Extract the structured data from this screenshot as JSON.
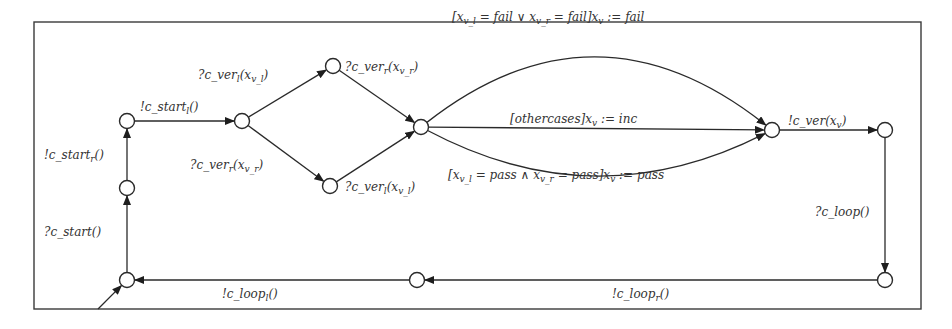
{
  "diagram": {
    "type": "timed-automaton-state-machine",
    "colors": {
      "stroke": "#2a2a2a",
      "text": "#333333",
      "background": "#ffffff"
    },
    "nodes": [
      {
        "id": "n1",
        "name": "start-left-location"
      },
      {
        "id": "n2",
        "name": "fork-location"
      },
      {
        "id": "n3",
        "name": "left-verified-location"
      },
      {
        "id": "n4",
        "name": "right-verified-location"
      },
      {
        "id": "n5",
        "name": "join-location"
      },
      {
        "id": "n6",
        "name": "verdict-location"
      },
      {
        "id": "n7",
        "name": "ver-sent-location"
      },
      {
        "id": "n8",
        "name": "loop-received-location"
      },
      {
        "id": "n9",
        "name": "loop-right-location"
      },
      {
        "id": "n10",
        "name": "initial-location"
      },
      {
        "id": "n11",
        "name": "start-received-location"
      }
    ],
    "edges": [
      {
        "from": "n10",
        "to": "n11",
        "label": {
          "text": "?c_start()",
          "parts": [
            [
              "?c_start()",
              ""
            ]
          ]
        }
      },
      {
        "from": "n11",
        "to": "n1",
        "label": {
          "text": "!c_start_r()",
          "parts": [
            [
              "!c_start",
              ""
            ],
            [
              "r",
              "sub"
            ],
            [
              "()",
              ""
            ]
          ]
        }
      },
      {
        "from": "n1",
        "to": "n2",
        "label": {
          "text": "!c_start_l()",
          "parts": [
            [
              "!c_start",
              ""
            ],
            [
              "l",
              "sub"
            ],
            [
              "()",
              ""
            ]
          ]
        }
      },
      {
        "from": "n2",
        "to": "n3",
        "label": {
          "text": "?c_ver_l(x_v_l)",
          "parts": [
            [
              "?c_ver",
              ""
            ],
            [
              "l",
              "sub"
            ],
            [
              "(x",
              ""
            ],
            [
              "v_l",
              "sub"
            ],
            [
              ")",
              ""
            ]
          ]
        }
      },
      {
        "from": "n2",
        "to": "n4",
        "label": {
          "text": "?c_ver_r(x_v_r)",
          "parts": [
            [
              "?c_ver",
              ""
            ],
            [
              "r",
              "sub"
            ],
            [
              "(x",
              ""
            ],
            [
              "v_r",
              "sub"
            ],
            [
              ")",
              ""
            ]
          ]
        }
      },
      {
        "from": "n3",
        "to": "n5",
        "label": {
          "text": "?c_ver_r(x_v_r)",
          "parts": [
            [
              "?c_ver",
              ""
            ],
            [
              "r",
              "sub"
            ],
            [
              "(x",
              ""
            ],
            [
              "v_r",
              "sub"
            ],
            [
              ")",
              ""
            ]
          ]
        }
      },
      {
        "from": "n4",
        "to": "n5",
        "label": {
          "text": "?c_ver_l(x_v_l)",
          "parts": [
            [
              "?c_ver",
              ""
            ],
            [
              "l",
              "sub"
            ],
            [
              "(x",
              ""
            ],
            [
              "v_l",
              "sub"
            ],
            [
              ")",
              ""
            ]
          ]
        }
      },
      {
        "from": "n5",
        "to": "n6",
        "label": {
          "text": "[x_v_l = fail ∨ x_v_r = fail]x_v := fail",
          "parts": [
            [
              "[x",
              ""
            ],
            [
              "v_l",
              "sub"
            ],
            [
              " = fail ∨ x",
              ""
            ],
            [
              "v_r",
              "sub"
            ],
            [
              " = fail]x",
              ""
            ],
            [
              "v",
              "sub"
            ],
            [
              " := fail",
              ""
            ]
          ]
        }
      },
      {
        "from": "n5",
        "to": "n6",
        "label": {
          "text": "[othercases]x_v := inc",
          "parts": [
            [
              "[othercases]x",
              ""
            ],
            [
              "v",
              "sub"
            ],
            [
              " := inc",
              ""
            ]
          ]
        }
      },
      {
        "from": "n5",
        "to": "n6",
        "label": {
          "text": "[x_v_l = pass ∧ x_v_r = pass]x_v := pass",
          "parts": [
            [
              "[x",
              ""
            ],
            [
              "v_l",
              "sub"
            ],
            [
              " = pass ∧ x",
              ""
            ],
            [
              "v_r",
              "sub"
            ],
            [
              " = pass]x",
              ""
            ],
            [
              "v",
              "sub"
            ],
            [
              " := pass",
              ""
            ]
          ]
        }
      },
      {
        "from": "n6",
        "to": "n7",
        "label": {
          "text": "!c_ver(x_v)",
          "parts": [
            [
              "!c_ver(x",
              ""
            ],
            [
              "v",
              "sub"
            ],
            [
              ")",
              ""
            ]
          ]
        }
      },
      {
        "from": "n7",
        "to": "n8",
        "label": {
          "text": "?c_loop()",
          "parts": [
            [
              "?c_loop()",
              ""
            ]
          ]
        }
      },
      {
        "from": "n8",
        "to": "n9",
        "label": {
          "text": "!c_loop_r()",
          "parts": [
            [
              "!c_loop",
              ""
            ],
            [
              "r",
              "sub"
            ],
            [
              "()",
              ""
            ]
          ]
        }
      },
      {
        "from": "n9",
        "to": "n10",
        "label": {
          "text": "!c_loop_l()",
          "parts": [
            [
              "!c_loop",
              ""
            ],
            [
              "l",
              "sub"
            ],
            [
              "()",
              ""
            ]
          ]
        }
      }
    ],
    "initial": "n10"
  }
}
